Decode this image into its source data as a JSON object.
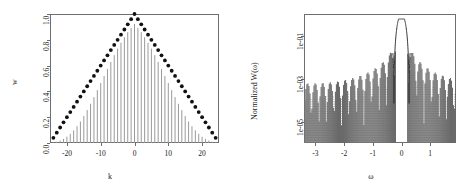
{
  "figure": {
    "title": "",
    "panels": [
      "lag-window-panel",
      "spectral-window-panel"
    ]
  },
  "left_panel": {
    "xlabel": "k",
    "ylabel": "w",
    "xticks": [
      "-20",
      "-10",
      "0",
      "10",
      "20"
    ],
    "yticks": [
      "0.0",
      "0.2",
      "0.4",
      "0.6",
      "0.8",
      "1.0"
    ]
  },
  "right_panel": {
    "xlabel": "ω",
    "ylabel": "Normalized W(ω)",
    "xticks": [
      "-3",
      "-2",
      "-1",
      "0",
      "1"
    ],
    "yticks": [
      "1e-05",
      "1e-03",
      "1e-01"
    ]
  },
  "chart_data": [
    {
      "type": "scatter",
      "name": "lag-window-panel",
      "title": "",
      "xlabel": "k",
      "ylabel": "w",
      "xlim": [
        -25,
        25
      ],
      "ylim": [
        0.0,
        1.0
      ],
      "xticks": [
        -20,
        -10,
        0,
        10,
        20
      ],
      "yticks": [
        0.0,
        0.2,
        0.4,
        0.6,
        0.8,
        1.0
      ],
      "grid": false,
      "legend": "none",
      "series": [
        {
          "name": "triangular-window-points",
          "style": "points",
          "marker": "filled-circle",
          "color": "#111111",
          "x": [
            -24,
            -23,
            -22,
            -21,
            -20,
            -19,
            -18,
            -17,
            -16,
            -15,
            -14,
            -13,
            -12,
            -11,
            -10,
            -9,
            -8,
            -7,
            -6,
            -5,
            -4,
            -3,
            -2,
            -1,
            0,
            1,
            2,
            3,
            4,
            5,
            6,
            7,
            8,
            9,
            10,
            11,
            12,
            13,
            14,
            15,
            16,
            17,
            18,
            19,
            20,
            21,
            22,
            23,
            24
          ],
          "y": [
            0.04,
            0.08,
            0.12,
            0.16,
            0.2,
            0.24,
            0.28,
            0.32,
            0.36,
            0.4,
            0.44,
            0.48,
            0.52,
            0.56,
            0.6,
            0.64,
            0.68,
            0.72,
            0.76,
            0.8,
            0.84,
            0.88,
            0.92,
            0.96,
            1.0,
            0.96,
            0.92,
            0.88,
            0.84,
            0.8,
            0.76,
            0.72,
            0.68,
            0.64,
            0.6,
            0.56,
            0.52,
            0.48,
            0.44,
            0.4,
            0.36,
            0.32,
            0.28,
            0.24,
            0.2,
            0.16,
            0.12,
            0.08,
            0.04
          ]
        },
        {
          "name": "modified-window-spikes",
          "style": "vertical-spikes",
          "color": "#9a9a9a",
          "x": [
            -24,
            -23,
            -22,
            -21,
            -20,
            -19,
            -18,
            -17,
            -16,
            -15,
            -14,
            -13,
            -12,
            -11,
            -10,
            -9,
            -8,
            -7,
            -6,
            -5,
            -4,
            -3,
            -2,
            -1,
            0,
            1,
            2,
            3,
            4,
            5,
            6,
            7,
            8,
            9,
            10,
            11,
            12,
            13,
            14,
            15,
            16,
            17,
            18,
            19,
            20,
            21,
            22,
            23,
            24
          ],
          "y": [
            0.004,
            0.01,
            0.019,
            0.032,
            0.049,
            0.071,
            0.098,
            0.13,
            0.167,
            0.209,
            0.255,
            0.304,
            0.356,
            0.41,
            0.465,
            0.52,
            0.575,
            0.629,
            0.681,
            0.731,
            0.777,
            0.82,
            0.859,
            0.893,
            0.923,
            0.893,
            0.859,
            0.82,
            0.777,
            0.731,
            0.681,
            0.629,
            0.575,
            0.52,
            0.465,
            0.41,
            0.356,
            0.304,
            0.255,
            0.209,
            0.167,
            0.13,
            0.098,
            0.071,
            0.049,
            0.032,
            0.019,
            0.01,
            0.004
          ]
        }
      ]
    },
    {
      "type": "line",
      "name": "spectral-window-panel",
      "title": "",
      "xlabel": "ω",
      "ylabel": "Normalized W(ω)",
      "xlim": [
        -3.4,
        1.9
      ],
      "ylim_log": [
        1e-06,
        1.0
      ],
      "yscale": "log",
      "xticks": [
        -3,
        -2,
        -1,
        0,
        1
      ],
      "yticks_log": [
        1e-05,
        0.001,
        0.1
      ],
      "grid": false,
      "legend": "none",
      "series": [
        {
          "name": "main-lobe-curve",
          "style": "line",
          "color": "#3a3a3a",
          "description": "smooth central main lobe peaking near 1.0 at omega = 0"
        },
        {
          "name": "sidelobe-spikes-solid",
          "style": "vertical-spikes",
          "color": "#6a6a6a",
          "description": "dark grey spikes, envelope decaying from ~1e-02 near centre to ~1e-05 at edges"
        },
        {
          "name": "sidelobe-spikes-dotted",
          "style": "vertical-spikes-dotted",
          "color": "#b8b8b8",
          "description": "light grey dotted spikes, oscillating lobed envelope above the solid spikes"
        }
      ]
    }
  ]
}
